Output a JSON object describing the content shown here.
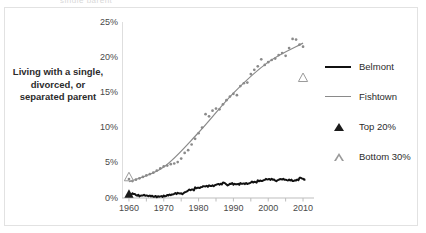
{
  "figure": {
    "clipped_header_text": "single parent",
    "y_axis_label": "Living with a single, divorced, or separated parent"
  },
  "legend": {
    "position": "right",
    "items": [
      {
        "label": "Belmont",
        "key": "line-thick-black",
        "color": "#111111"
      },
      {
        "label": "Fishtown",
        "key": "line-thin-gray",
        "color": "#8a8a8a"
      },
      {
        "label": "Top 20%",
        "key": "triangle-filled",
        "color": "#1b1b1b"
      },
      {
        "label": "Bottom 30%",
        "key": "triangle-open",
        "color": "#9a9a9a"
      }
    ]
  },
  "chart_data": {
    "type": "line",
    "title": "",
    "xlabel": "",
    "ylabel": "Living with a single, divorced, or separated parent",
    "xlim": [
      1958,
      2012
    ],
    "ylim": [
      0,
      25
    ],
    "xticks": [
      1960,
      1970,
      1980,
      1990,
      2000,
      2010
    ],
    "xticklabels": [
      "1960",
      "1970",
      "1980",
      "1990",
      "2000",
      "2010"
    ],
    "minor_xtick_step": 5,
    "yticks": [
      0,
      5,
      10,
      15,
      20,
      25
    ],
    "yticklabels": [
      "0%",
      "5%",
      "10%",
      "15%",
      "20%",
      "25%"
    ],
    "grid": false,
    "series": [
      {
        "name": "Fishtown",
        "kind": "scatter+trend",
        "color": "#8a8a8a",
        "x": [
          1960,
          1961,
          1962,
          1963,
          1964,
          1965,
          1966,
          1967,
          1968,
          1969,
          1970,
          1971,
          1972,
          1973,
          1974,
          1975,
          1976,
          1977,
          1978,
          1979,
          1980,
          1981,
          1982,
          1983,
          1984,
          1985,
          1986,
          1987,
          1988,
          1989,
          1990,
          1991,
          1992,
          1993,
          1994,
          1995,
          1996,
          1997,
          1998,
          1999,
          2000,
          2001,
          2002,
          2003,
          2004,
          2005,
          2006,
          2007,
          2008,
          2009,
          2010
        ],
        "values": [
          2.7,
          2.4,
          2.6,
          2.8,
          3.0,
          3.2,
          3.4,
          3.6,
          3.9,
          4.2,
          4.5,
          4.6,
          4.8,
          4.9,
          5.1,
          5.6,
          6.4,
          6.8,
          7.6,
          8.4,
          9.2,
          10.0,
          11.9,
          11.6,
          12.4,
          12.7,
          12.6,
          13.3,
          13.9,
          14.4,
          14.8,
          14.6,
          15.9,
          16.3,
          16.4,
          17.6,
          18.2,
          18.7,
          19.7,
          18.9,
          19.3,
          19.6,
          19.8,
          20.3,
          20.6,
          20.2,
          21.3,
          22.6,
          22.5,
          21.8,
          21.5
        ],
        "trend": {
          "x": [
            1960,
            1970,
            1980,
            1990,
            2000,
            2010
          ],
          "values": [
            2.3,
            4.4,
            9.3,
            14.9,
            19.3,
            22.0
          ]
        }
      },
      {
        "name": "Belmont",
        "kind": "line",
        "color": "#111111",
        "x": [
          1960,
          1961,
          1962,
          1963,
          1964,
          1965,
          1966,
          1967,
          1968,
          1969,
          1970,
          1971,
          1972,
          1973,
          1974,
          1975,
          1976,
          1977,
          1978,
          1979,
          1980,
          1981,
          1982,
          1983,
          1984,
          1985,
          1986,
          1987,
          1988,
          1989,
          1990,
          1991,
          1992,
          1993,
          1994,
          1995,
          1996,
          1997,
          1998,
          1999,
          2000,
          2001,
          2002,
          2003,
          2004,
          2005,
          2006,
          2007,
          2008,
          2009,
          2010
        ],
        "values": [
          0.5,
          0.6,
          0.4,
          0.3,
          0.4,
          0.3,
          0.3,
          0.2,
          0.2,
          0.2,
          0.3,
          0.4,
          0.5,
          0.6,
          0.7,
          0.6,
          0.9,
          1.1,
          1.2,
          1.4,
          1.5,
          1.6,
          1.7,
          1.7,
          1.8,
          1.9,
          2.0,
          2.1,
          1.9,
          2.0,
          2.0,
          1.9,
          2.1,
          2.0,
          2.1,
          2.2,
          2.3,
          2.4,
          2.5,
          2.6,
          2.7,
          2.6,
          2.5,
          2.6,
          2.7,
          2.5,
          2.6,
          2.4,
          2.6,
          2.8,
          2.7
        ]
      }
    ],
    "markers": [
      {
        "name": "Top 20%",
        "style": "triangle-filled",
        "x": 1960,
        "y": 0.6,
        "color": "#1b1b1b"
      },
      {
        "name": "Bottom 30%",
        "style": "triangle-open",
        "x": 1960,
        "y": 3.0,
        "color": "#9a9a9a"
      },
      {
        "name": "Bottom 30%",
        "style": "triangle-open",
        "x": 2010,
        "y": 17.1,
        "color": "#9a9a9a"
      }
    ]
  }
}
